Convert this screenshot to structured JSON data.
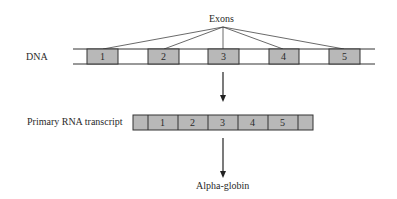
{
  "diagram": {
    "exons_label": "Exons",
    "dna_label": "DNA",
    "rna_label": "Primary RNA transcript",
    "product_label": "Alpha-globin",
    "dna_exons": [
      "1",
      "2",
      "3",
      "4",
      "5"
    ],
    "rna_exons": [
      "1",
      "2",
      "3",
      "4",
      "5"
    ],
    "colors": {
      "exon_fill": "#b8b8b8",
      "intron_fill": "#ffffff",
      "line": "#333333",
      "background": "#ffffff"
    }
  }
}
